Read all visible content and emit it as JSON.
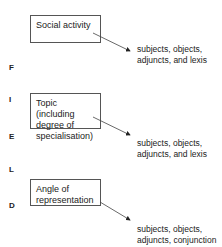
{
  "side_label": [
    "F",
    "I",
    "E",
    "L",
    "D"
  ],
  "boxes": [
    {
      "label": "Social activity",
      "output": [
        "subjects, objects,",
        "adjuncts, and lexis"
      ]
    },
    {
      "label": "Topic (including degree of specialisation)",
      "output": [
        "subjects, objects,",
        "adjuncts, and lexis"
      ]
    },
    {
      "label": "Angle of representation",
      "output": [
        "subjects, objects,",
        "adjuncts, conjunction"
      ]
    }
  ]
}
